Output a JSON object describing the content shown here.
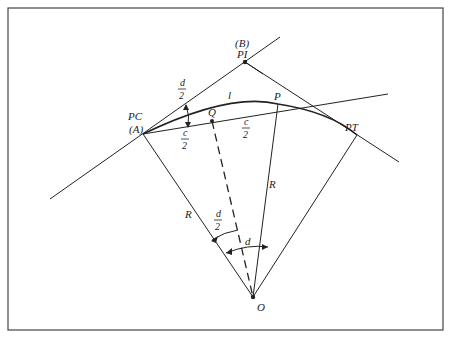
{
  "diagram": {
    "type": "circular-curve-geometry",
    "labels": {
      "pi_label": "PI",
      "b_label": "(B)",
      "pc_label": "PC",
      "a_label": "(A)",
      "pt_label": "PT",
      "p_label": "P",
      "q_label": "Q",
      "o_label": "O",
      "arc_label": "l",
      "radius_label": "R",
      "deflection_num": "d",
      "deflection_den": "2",
      "chord_num": "c",
      "chord_den": "2",
      "central_angle": "d"
    },
    "colors": {
      "line": "#222222",
      "frame": "#444444",
      "background": "#ffffff"
    }
  }
}
